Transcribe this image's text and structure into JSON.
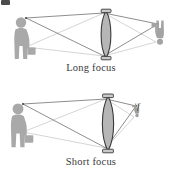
{
  "figure": {
    "background_color": "#ffffff",
    "width": 182,
    "height": 179,
    "corner_mark_color": "#2b2b2b"
  },
  "captions": {
    "long_focus": "Long focus",
    "short_focus": "Short focus"
  },
  "labels": {
    "focal_point": "f"
  },
  "colors": {
    "lens_fill": "#b6b6b6",
    "lens_outline": "#3a3a3a",
    "figure_silhouette": "#a9a9a9",
    "figure_silhouette_dark": "#9a9a9a",
    "ray_dark": "#555555",
    "ray_light": "#bdbdbd",
    "caption_text": "#3a3a3a"
  },
  "diagrams": [
    {
      "name": "long-focus",
      "caption": "Long focus",
      "object": {
        "role": "object-person",
        "side": "left",
        "orientation": "upright",
        "height_px": 44,
        "x": 20,
        "y_top": 16,
        "y_bottom": 60
      },
      "lens": {
        "role": "biconvex-lens",
        "center_x": 106,
        "top_y": 11,
        "bottom_y": 58,
        "half_thickness": 6
      },
      "image": {
        "role": "image-person",
        "side": "right",
        "orientation": "inverted",
        "height_px": 27,
        "x": 157,
        "y_top": 19,
        "y_bottom": 46
      },
      "rays": [
        {
          "from": "object-head",
          "to": "image-foot",
          "shade": "dark"
        },
        {
          "from": "object-foot",
          "to": "image-head",
          "shade": "light"
        }
      ],
      "focal_point_shown": false
    },
    {
      "name": "short-focus",
      "caption": "Short focus",
      "object": {
        "role": "object-person",
        "side": "left",
        "orientation": "upright",
        "height_px": 47,
        "x": 17,
        "y_top": 101,
        "y_bottom": 148
      },
      "lens": {
        "role": "biconvex-lens",
        "center_x": 108,
        "top_y": 96,
        "bottom_y": 151,
        "half_thickness": 7
      },
      "image": {
        "role": "image-person",
        "side": "right",
        "orientation": "inverted",
        "height_px": 15,
        "x": 135,
        "y_top": 103,
        "y_bottom": 118
      },
      "rays": [
        {
          "from": "object-head",
          "to": "image-foot",
          "shade": "dark"
        },
        {
          "from": "object-foot",
          "to": "image-head",
          "shade": "light"
        }
      ],
      "focal_point_shown": true,
      "focal_label": "f"
    }
  ]
}
